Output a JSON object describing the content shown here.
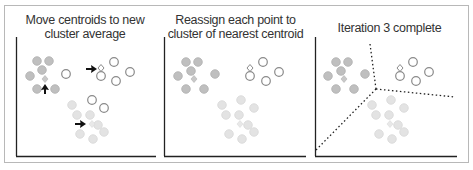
{
  "panels": [
    {
      "title_line1": "Move centroids to new",
      "title_line2": "cluster average"
    },
    {
      "title_line1": "Reassign each point to",
      "title_line2": "cluster of nearest centroid"
    },
    {
      "title_line1": "Iteration 3 complete",
      "title_line2": ""
    }
  ],
  "colors": {
    "cluster_a": "#bfbfbf",
    "cluster_a_stroke": "#aaaaaa",
    "cluster_b_stroke": "#888888",
    "cluster_c": "#e3e3e3",
    "cluster_c_stroke": "#d6d6d6",
    "axis": "#222222",
    "arrow": "#111111",
    "boundary": "#222222"
  }
}
